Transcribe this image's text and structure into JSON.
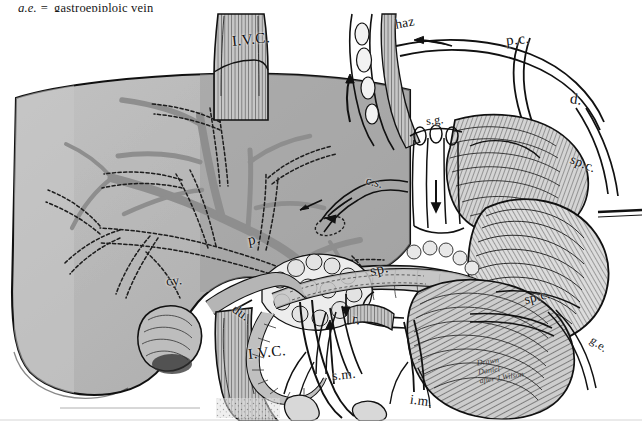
{
  "plate": {
    "kind": "anatomical-engraving",
    "subject": "Portal venous system: liver, spleen, pancreas, stomach and tributary veins",
    "background_color": "#ffffff",
    "ink_color": "#1a1a1a",
    "liver_tone": "#b9b9b9",
    "vessel_tone": "#9a9a9a",
    "organ_tone": "#c9c9c9"
  },
  "legend": {
    "abbr": "g.e.",
    "equals": "=",
    "expansion": "gastroepiploic vein"
  },
  "labels": [
    {
      "id": "ivc-upper",
      "text": "I.V.C.",
      "x": 232,
      "y": 32,
      "size": "big",
      "rot": "rot-l6",
      "note": "inferior vena cava, suprahepatic"
    },
    {
      "id": "haz",
      "text": "haz",
      "x": 395,
      "y": 16,
      "size": "mid",
      "rot": "rot-l10",
      "note": "azygos / hemiazygos vein"
    },
    {
      "id": "pc",
      "text": "p.c.",
      "x": 506,
      "y": 32,
      "size": "big",
      "rot": "rot-l6",
      "note": "posterior gastric / phrenic communication"
    },
    {
      "id": "d",
      "text": "d.",
      "x": 570,
      "y": 92,
      "size": "big",
      "rot": "rot-r8",
      "note": "duodenal vein"
    },
    {
      "id": "sg",
      "text": "s.g.",
      "x": 426,
      "y": 114,
      "size": "sm",
      "rot": "rot-l6",
      "note": "short gastric veins"
    },
    {
      "id": "cs",
      "text": "c.s.",
      "x": 366,
      "y": 176,
      "size": "sm",
      "rot": "rot-r14",
      "note": "coronary / left gastric vein"
    },
    {
      "id": "spc-right",
      "text": "sp.c.",
      "x": 570,
      "y": 157,
      "size": "mid",
      "rot": "rot-r22",
      "note": "splenocolic vein (upper)"
    },
    {
      "id": "p",
      "text": "p.",
      "x": 248,
      "y": 232,
      "size": "big",
      "rot": "rot-l10",
      "note": "portal vein"
    },
    {
      "id": "sp",
      "text": "sp.",
      "x": 370,
      "y": 262,
      "size": "big",
      "rot": "rot-l14",
      "note": "splenic vein"
    },
    {
      "id": "cy",
      "text": "cy.",
      "x": 166,
      "y": 274,
      "size": "mid",
      "rot": "rot-l6",
      "note": "cystic vein"
    },
    {
      "id": "du",
      "text": "du.",
      "x": 232,
      "y": 306,
      "size": "mid",
      "rot": "rot-r35",
      "note": "duodenum"
    },
    {
      "id": "r",
      "text": "r.",
      "x": 352,
      "y": 312,
      "size": "big",
      "rot": "rot-r8",
      "note": "renal vein"
    },
    {
      "id": "spc-lower",
      "text": "sp.c.",
      "x": 524,
      "y": 290,
      "size": "mid",
      "rot": "rot-l14",
      "note": "splenocolic vein (lower)"
    },
    {
      "id": "ge",
      "text": "g.e.",
      "x": 590,
      "y": 338,
      "size": "sm",
      "rot": "rot-r35",
      "note": "gastroepiploic vein"
    },
    {
      "id": "ivc-lower",
      "text": "I.V.C.",
      "x": 248,
      "y": 345,
      "size": "big",
      "rot": "rot-l6",
      "note": "inferior vena cava, infrahepatic"
    },
    {
      "id": "sm",
      "text": "s.m.",
      "x": 332,
      "y": 368,
      "size": "mid",
      "rot": "rot-l6",
      "note": "superior mesenteric vein"
    },
    {
      "id": "im",
      "text": "i.m.",
      "x": 410,
      "y": 394,
      "size": "mid",
      "rot": "rot-r8",
      "note": "inferior mesenteric vein"
    }
  ],
  "signature": {
    "line1": "Drawn",
    "line2": "Daniel",
    "line3": "after J.Wilson",
    "x": 478,
    "y": 355
  },
  "structures": {
    "liver": "liver-silhouette",
    "spleen": "spleen",
    "stomach": "stomach",
    "pancreas": "pancreas",
    "duodenum": "duodenum",
    "kidney_vessels": "renal-vessels",
    "ivc": "inferior-vena-cava",
    "portal_vein": "portal-vein",
    "splenic_vein": "splenic-vein",
    "mesenteric_veins": "mesenteric-veins",
    "arrows": "flow-direction-arrows"
  }
}
